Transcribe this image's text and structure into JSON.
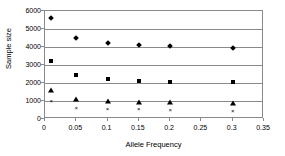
{
  "chart_data": {
    "type": "scatter",
    "title": "",
    "xlabel": "Allele Frequency",
    "ylabel": "Sample size",
    "xlim": [
      0,
      0.35
    ],
    "ylim": [
      0,
      6000
    ],
    "xticks": [
      0,
      0.05,
      0.1,
      0.15,
      0.2,
      0.25,
      0.3,
      0.35
    ],
    "xtick_labels": [
      "0",
      "0.05",
      "0.1",
      "0.15",
      "0.2",
      "0.25",
      "0.3",
      "0.35"
    ],
    "yticks": [
      0,
      1000,
      2000,
      3000,
      4000,
      5000,
      6000
    ],
    "ytick_labels": [
      "0",
      "1000",
      "2000",
      "3000",
      "4000",
      "5000",
      "6000"
    ],
    "grid": "horizontal",
    "gridlines_y": [
      1000,
      2000,
      3000,
      4000,
      5000
    ],
    "legend": "none",
    "x": [
      0.01,
      0.05,
      0.1,
      0.15,
      0.2,
      0.3
    ],
    "series": [
      {
        "name": "series-diamond",
        "marker": "diamond",
        "color": "#000000",
        "values": [
          5600,
          4520,
          4250,
          4100,
          4030,
          3950
        ]
      },
      {
        "name": "series-square",
        "marker": "square",
        "color": "#000000",
        "values": [
          3250,
          2450,
          2240,
          2120,
          2080,
          2060
        ]
      },
      {
        "name": "series-triangle",
        "marker": "triangle",
        "color": "#000000",
        "values": [
          1620,
          1110,
          1020,
          970,
          940,
          880
        ]
      },
      {
        "name": "series-x",
        "marker": "x",
        "color": "#000000",
        "values": [
          1000,
          620,
          560,
          530,
          500,
          450
        ]
      }
    ]
  }
}
